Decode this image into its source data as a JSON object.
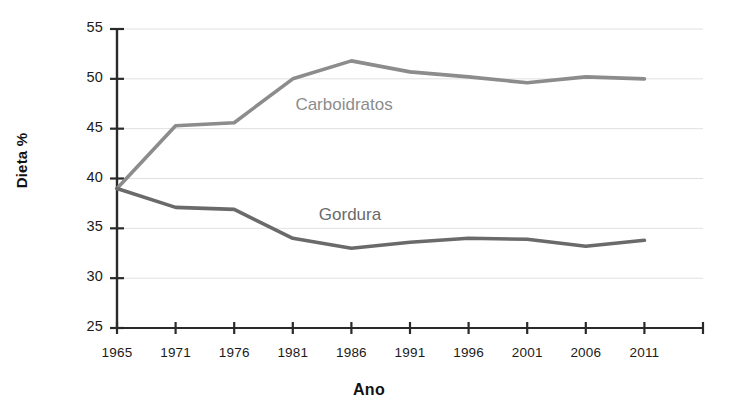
{
  "chart_data": {
    "type": "line",
    "title": "",
    "xlabel": "Ano",
    "ylabel": "Dieta %",
    "x": [
      1965,
      1971,
      1976,
      1981,
      1986,
      1991,
      1996,
      2001,
      2006,
      2011
    ],
    "x_tick_labels": [
      "1965",
      "1971",
      "1976",
      "1981",
      "1986",
      "1991",
      "1996",
      "2001",
      "2006",
      "2011"
    ],
    "y_tick_labels": [
      "25",
      "30",
      "35",
      "40",
      "45",
      "50",
      "55"
    ],
    "y_ticks": [
      25,
      30,
      35,
      40,
      45,
      50,
      55
    ],
    "ylim": [
      25,
      55
    ],
    "xlim": [
      1965,
      2016
    ],
    "grid": "horizontal",
    "legend": "inline-labels",
    "series": [
      {
        "name": "Carboidratos",
        "color": "#8c8c8c",
        "label_x": 1986,
        "label_y": 47.3,
        "values": [
          39.0,
          45.3,
          45.6,
          50.0,
          51.8,
          50.7,
          50.2,
          49.6,
          50.2,
          50.0
        ]
      },
      {
        "name": "Gordura",
        "color": "#6a6a6a",
        "label_x": 1988,
        "label_y": 36.2,
        "values": [
          39.0,
          37.1,
          36.9,
          34.0,
          33.0,
          33.6,
          34.0,
          33.9,
          33.2,
          33.8
        ]
      }
    ]
  },
  "axes": {
    "y_title": "Dieta %",
    "x_title": "Ano"
  }
}
